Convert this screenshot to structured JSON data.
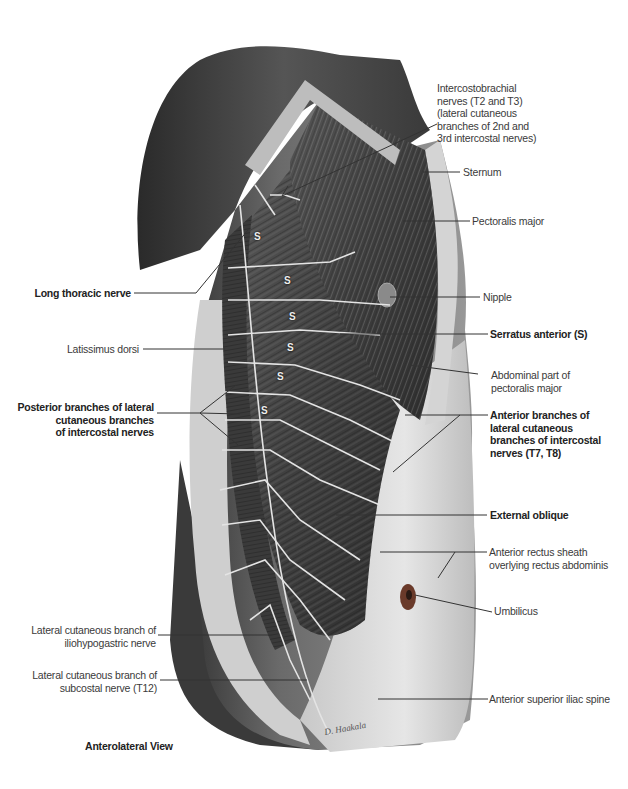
{
  "figure": {
    "view_title": "Anterolateral View",
    "muscle_marker": "S",
    "marker_positions": [
      [
        254,
        232
      ],
      [
        284,
        276
      ],
      [
        289,
        312
      ],
      [
        287,
        343
      ],
      [
        277,
        372
      ],
      [
        261,
        406
      ]
    ],
    "colors": {
      "skin_dark": "#3c3c3c",
      "skin_mid": "#8a8a8a",
      "skin_light": "#d8d8d8",
      "muscle": "#4a4a4a",
      "nerve": "#e8e8e8",
      "umbilicus": "#6a3a2a",
      "leader_line": "#333333",
      "label_text": "#3a3a3a"
    }
  },
  "labels": {
    "intercostobrachial": [
      "Intercostobrachial",
      "nerves (T2 and T3)",
      "(lateral cutaneous",
      "branches of 2nd and",
      "3rd intercostal nerves)"
    ],
    "sternum": [
      "Sternum"
    ],
    "pectoralis_major": [
      "Pectoralis major"
    ],
    "nipple": [
      "Nipple"
    ],
    "serratus_anterior": [
      "Serratus anterior (S)"
    ],
    "abdominal_pectoralis": [
      "Abdominal part of",
      "pectoralis major"
    ],
    "anterior_branches": [
      "Anterior branches of",
      "lateral cutaneous",
      "branches of intercostal",
      "nerves (T7, T8)"
    ],
    "external_oblique": [
      "External oblique"
    ],
    "anterior_rectus": [
      "Anterior rectus sheath",
      "overlying rectus abdominis"
    ],
    "umbilicus": [
      "Umbilicus"
    ],
    "asis": [
      "Anterior superior iliac spine"
    ],
    "long_thoracic": [
      "Long thoracic nerve"
    ],
    "latissimus": [
      "Latissimus dorsi"
    ],
    "posterior_branches": [
      "Posterior branches of lateral",
      "cutaneous branches",
      "of intercostal nerves"
    ],
    "iliohypogastric": [
      "Lateral cutaneous branch of",
      "iliohypogastric nerve"
    ],
    "subcostal": [
      "Lateral cutaneous branch of",
      "subcostal nerve (T12)"
    ]
  }
}
